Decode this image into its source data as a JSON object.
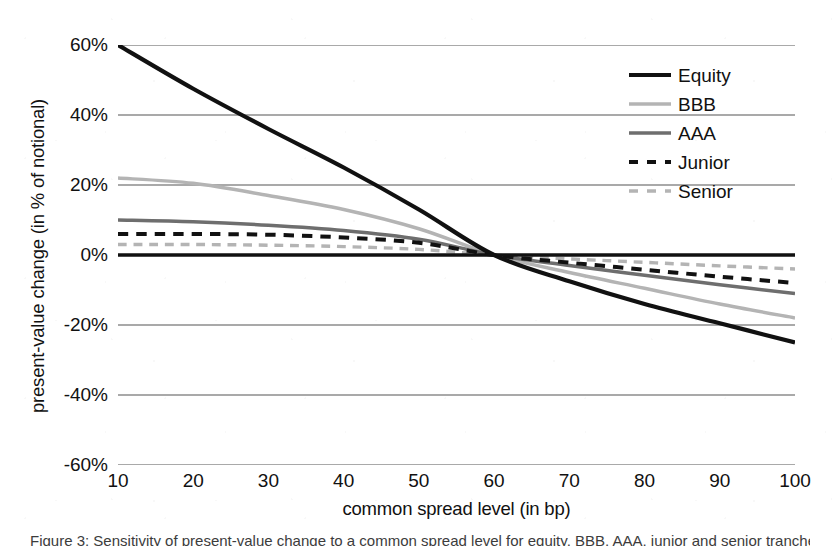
{
  "chart_data": {
    "type": "line",
    "title": "",
    "xlabel": "common spread level (in bp)",
    "ylabel": "present-value change (in % of notional)",
    "xlim": [
      10,
      100
    ],
    "ylim": [
      -60,
      60
    ],
    "xticks": [
      "10",
      "20",
      "30",
      "40",
      "50",
      "60",
      "70",
      "80",
      "90",
      "100"
    ],
    "yticks": [
      "60%",
      "40%",
      "20%",
      "0%",
      "-20%",
      "-40%",
      "-60%"
    ],
    "ytick_values": [
      60,
      40,
      20,
      0,
      -20,
      -40,
      -60
    ],
    "xtick_values": [
      10,
      20,
      30,
      40,
      50,
      60,
      70,
      80,
      90,
      100
    ],
    "grid": "horizontal",
    "legend_position": "top-right",
    "x": [
      10,
      20,
      30,
      40,
      50,
      60,
      70,
      80,
      90,
      100
    ],
    "series": [
      {
        "name": "Equity",
        "style": "solid",
        "color": "#111111",
        "width": 4.2,
        "values": [
          60.0,
          47.5,
          36.0,
          25.0,
          13.0,
          0.0,
          -7.5,
          -14.0,
          -19.5,
          -25.0
        ]
      },
      {
        "name": "BBB",
        "style": "solid",
        "color": "#b4b4b4",
        "width": 3.4,
        "values": [
          22.0,
          20.5,
          17.0,
          13.0,
          7.5,
          0.0,
          -5.0,
          -9.5,
          -14.0,
          -18.0
        ]
      },
      {
        "name": "AAA",
        "style": "solid",
        "color": "#6e6e6e",
        "width": 3.4,
        "values": [
          10.0,
          9.5,
          8.5,
          7.0,
          4.5,
          0.0,
          -3.0,
          -5.8,
          -8.5,
          -11.0
        ]
      },
      {
        "name": "Junior",
        "style": "dashed",
        "color": "#111111",
        "width": 4.0,
        "values": [
          6.0,
          6.0,
          5.8,
          5.0,
          3.5,
          0.0,
          -2.2,
          -4.2,
          -6.2,
          -8.0
        ]
      },
      {
        "name": "Senior",
        "style": "dashed",
        "color": "#b4b4b4",
        "width": 3.4,
        "values": [
          3.0,
          3.0,
          2.8,
          2.4,
          1.6,
          0.0,
          -1.1,
          -2.1,
          -3.1,
          -4.0
        ]
      }
    ],
    "legend": [
      "Equity",
      "BBB",
      "AAA",
      "Junior",
      "Senior"
    ],
    "zero_line": true,
    "annotation": "All five present-value profiles intersect at a common spread level of 60 bp, where the present-value change is 0%."
  },
  "caption": {
    "text": "Figure 3: Sensitivity of present-value change to a common spread level for equity, BBB, AAA, junior and senior tranches."
  },
  "colors": {
    "equity": "#111111",
    "bbb": "#b4b4b4",
    "aaa": "#6e6e6e",
    "junior": "#111111",
    "senior": "#b4b4b4",
    "gridline": "#555555",
    "axis": "#111111",
    "background": "#ffffff"
  }
}
